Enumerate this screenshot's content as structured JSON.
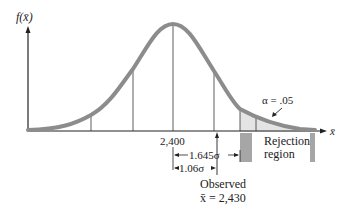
{
  "diagram": {
    "y_axis_label": "f(x̄)",
    "x_axis_label": "x̄",
    "mean_label": "2,400",
    "alpha_label": "α = .05",
    "rejection_label_line1": "Rejection",
    "rejection_label_line2": "region",
    "critical_distance_label": "1.645σ",
    "critical_distance_sub": "x̄",
    "observed_distance_label": "1.06σ",
    "observed_distance_sub": "x̄",
    "observed_label_line1": "Observed",
    "observed_label_line2": "x̄ = 2,430"
  },
  "colors": {
    "curve": "#8c8c8c",
    "tail_fill": "#e4e4e4",
    "rejection_box": "#a6a6a6",
    "axis": "#222222"
  }
}
